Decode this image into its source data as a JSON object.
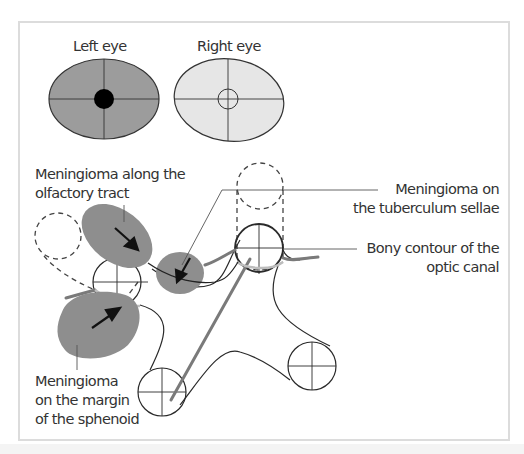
{
  "eyes": {
    "left": {
      "label": "Left eye",
      "fill": "#9c9c9c",
      "defect": "central scotoma (filled black dot)"
    },
    "right": {
      "label": "Right eye",
      "fill": "#e6e6e6",
      "defect": "central ring (outline)"
    }
  },
  "labels": {
    "olfactory": [
      "Meningioma along the",
      "olfactory tract"
    ],
    "tuberculum": [
      "Meningioma on",
      "the tuberculum sellae"
    ],
    "optic_canal": [
      "Bony contour of the",
      "optic canal"
    ],
    "sphenoid": [
      "Meningioma",
      "on the margin",
      "of the sphenoid"
    ]
  },
  "colors": {
    "tumor": "#8e8e8e",
    "outline": "#2a2a2a",
    "nerve": "#7a7a7a",
    "frame": "#dcdcdc"
  }
}
